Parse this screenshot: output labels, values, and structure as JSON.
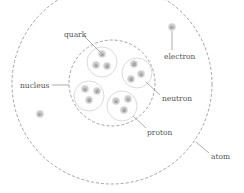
{
  "diagram": {
    "labels": {
      "quark": "quark",
      "electron": "electron",
      "nucleus": "nucleus",
      "neutron": "neutron",
      "proton": "proton",
      "atom": "atom"
    },
    "electrons": [
      {
        "symbol": "e-",
        "x": 172,
        "y": 27
      },
      {
        "symbol": "e-",
        "x": 40,
        "y": 114
      }
    ],
    "nucleons": [
      {
        "type": "proton",
        "quarks": [
          "u",
          "u",
          "d"
        ]
      },
      {
        "type": "neutron",
        "quarks": [
          "d",
          "d",
          "u"
        ]
      },
      {
        "type": "proton",
        "quarks": [
          "u",
          "d",
          "d"
        ]
      },
      {
        "type": "proton",
        "quarks": [
          "u",
          "u",
          "d"
        ]
      }
    ],
    "colors": {
      "line": "#8a8a8a",
      "dashed": "#9a9a9a",
      "particle": "#c8c8c8",
      "text": "#555555"
    }
  }
}
